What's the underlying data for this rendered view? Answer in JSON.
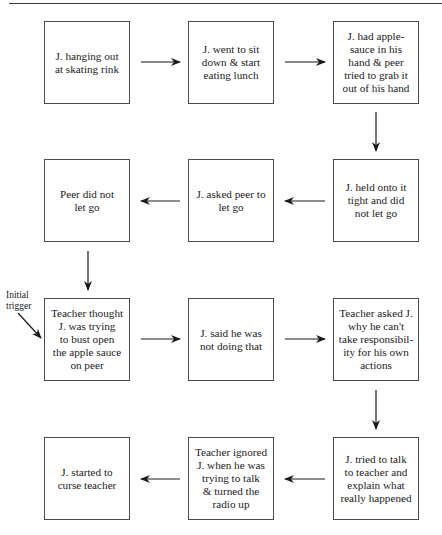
{
  "diagram": {
    "type": "flowchart",
    "boxes": [
      {
        "id": "b1",
        "text": "J. hanging out\nat skating rink"
      },
      {
        "id": "b2",
        "text": "J. went to sit\ndown & start\neating lunch"
      },
      {
        "id": "b3",
        "text": "J. had apple-\nsauce in his\nhand & peer\ntried to grab it\nout of his hand"
      },
      {
        "id": "b4",
        "text": "J. held onto it\ntight and did\nnot let go"
      },
      {
        "id": "b5",
        "text": "J. asked peer to\nlet go"
      },
      {
        "id": "b6",
        "text": "Peer did not\nlet go"
      },
      {
        "id": "b7",
        "text": "Teacher thought\nJ. was trying\nto bust open\nthe apple sauce\non peer"
      },
      {
        "id": "b8",
        "text": "J. said he was\nnot doing that"
      },
      {
        "id": "b9",
        "text": "Teacher asked J.\nwhy he can't\ntake responsibil-\nity for his own\nactions"
      },
      {
        "id": "b10",
        "text": "J. tried to talk\nto teacher and\nexplain what\nreally happened"
      },
      {
        "id": "b11",
        "text": "Teacher ignored\nJ. when he was\ntrying to talk\n& turned the\nradio up"
      },
      {
        "id": "b12",
        "text": "J. started to\ncurse teacher"
      }
    ],
    "edges": [
      {
        "from": "b1",
        "to": "b2"
      },
      {
        "from": "b2",
        "to": "b3"
      },
      {
        "from": "b3",
        "to": "b4"
      },
      {
        "from": "b4",
        "to": "b5"
      },
      {
        "from": "b5",
        "to": "b6"
      },
      {
        "from": "b6",
        "to": "b7"
      },
      {
        "from": "b7",
        "to": "b8"
      },
      {
        "from": "b8",
        "to": "b9"
      },
      {
        "from": "b9",
        "to": "b10"
      },
      {
        "from": "b10",
        "to": "b11"
      },
      {
        "from": "b11",
        "to": "b12"
      }
    ],
    "annotation": {
      "text": "Initial\ntrigger",
      "points_to": "b7"
    }
  }
}
